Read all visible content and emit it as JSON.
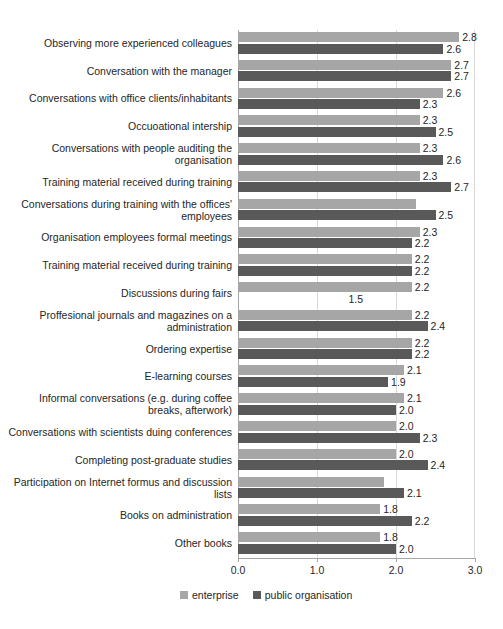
{
  "chart_data": {
    "type": "bar",
    "orientation": "horizontal",
    "title": "",
    "xlabel": "",
    "ylabel": "",
    "xlim": [
      0.0,
      3.0
    ],
    "xticks": [
      "0.0",
      "1.0",
      "2.0",
      "3.0"
    ],
    "grid": true,
    "legend_position": "bottom",
    "categories": [
      "Observing more experienced colleagues",
      "Conversation with the manager",
      "Conversations with office clients/inhabitants",
      "Occuoational intership",
      "Conversations with people auditing the organisation",
      "Training material received during training",
      "Conversations during training with the offices' employees",
      "Organisation employees formal meetings",
      "Training material received during training",
      "Discussions during fairs",
      "Proffesional journals and magazines on a administration",
      "Ordering expertise",
      "E-learning courses",
      "Informal conversations (e.g. during coffee breaks, afterwork)",
      "Conversations with scientists duing conferences",
      "Completing post-graduate studies",
      "Participation on Internet formus and discussion lists",
      "Books on administration",
      "Other books"
    ],
    "series": [
      {
        "name": "enterprise",
        "color": "#a6a6a6",
        "values": [
          2.8,
          2.7,
          2.6,
          2.3,
          2.3,
          2.3,
          2.25,
          2.3,
          2.2,
          2.2,
          2.2,
          2.2,
          2.1,
          2.1,
          2.0,
          2.0,
          1.85,
          1.8,
          1.8
        ],
        "labels": [
          "2.8",
          "2.7",
          "2.6",
          "2.3",
          "2.3",
          "2.3",
          "",
          "2.3",
          "2.2",
          "2.2",
          "2.2",
          "2.2",
          "2.1",
          "2.1",
          "2.0",
          "2.0",
          "",
          "1.8",
          "1.8"
        ]
      },
      {
        "name": "public organisation",
        "color": "#595959",
        "values": [
          2.6,
          2.7,
          2.3,
          2.5,
          2.6,
          2.7,
          2.5,
          2.2,
          2.2,
          0.0,
          2.4,
          2.2,
          1.9,
          2.0,
          2.3,
          2.4,
          2.1,
          2.2,
          2.0
        ],
        "labels": [
          "2.6",
          "2.7",
          "2.3",
          "2.5",
          "2.6",
          "2.7",
          "2.5",
          "2.2",
          "2.2",
          "1.5",
          "2.4",
          "2.2",
          "1.9",
          "2.0",
          "2.3",
          "2.4",
          "2.1",
          "2.2",
          "2.0"
        ]
      }
    ]
  },
  "legend": {
    "items": [
      {
        "label": "enterprise"
      },
      {
        "label": "public organisation"
      }
    ]
  }
}
